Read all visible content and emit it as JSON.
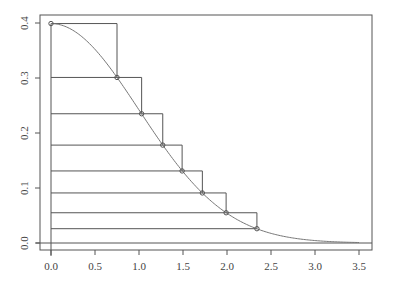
{
  "chart_data": {
    "type": "line",
    "title": "",
    "xlabel": "",
    "ylabel": "",
    "xlim": [
      -0.11,
      3.64
    ],
    "ylim": [
      -0.012,
      0.415
    ],
    "grid": false,
    "legend": null,
    "x_ticks": [
      0.0,
      0.5,
      1.0,
      1.5,
      2.0,
      2.5,
      3.0,
      3.5
    ],
    "x_tick_labels": [
      "0.0",
      "0.5",
      "1.0",
      "1.5",
      "2.0",
      "2.5",
      "3.0",
      "3.5"
    ],
    "y_ticks": [
      0.0,
      0.1,
      0.2,
      0.3,
      0.4
    ],
    "y_tick_labels": [
      "0.0",
      "0.1",
      "0.2",
      "0.3",
      "0.4"
    ],
    "series": [
      {
        "name": "density curve",
        "kind": "curve",
        "function": "standard normal density",
        "x_range": [
          0,
          3.5
        ]
      },
      {
        "name": "ziggurat points",
        "kind": "points",
        "x": [
          0.0,
          0.75,
          1.03,
          1.27,
          1.49,
          1.72,
          1.99,
          2.34
        ],
        "y": [
          0.399,
          0.301,
          0.235,
          0.178,
          0.131,
          0.091,
          0.055,
          0.026
        ]
      },
      {
        "name": "ziggurat layers",
        "kind": "steps",
        "description": "horizontal line at each point's y from x=0 to the next point's x, then vertical down to the next point"
      }
    ],
    "reference_lines": {
      "h": 0,
      "v": 0
    }
  }
}
